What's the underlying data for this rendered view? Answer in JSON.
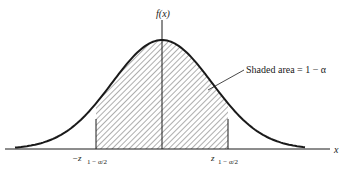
{
  "figure": {
    "y_axis_label": "f(x)",
    "x_axis_label": "x",
    "annotation": "Shaded area = 1 − α",
    "left_bound_label": "−z",
    "left_bound_subscript": "1 − α/2",
    "right_bound_label": "z",
    "right_bound_subscript": "1 − α/2",
    "colors": {
      "ink": "#1a1a1a",
      "background": "#ffffff"
    }
  },
  "chart_data": {
    "type": "area",
    "title": "",
    "curve": "standard normal density",
    "xlabel": "x",
    "ylabel": "f(x)",
    "shaded_region": [
      "-z_{1-α/2}",
      "z_{1-α/2}"
    ],
    "shaded_area": "1 − α",
    "annotations": [
      "Shaded area = 1 − α"
    ]
  }
}
